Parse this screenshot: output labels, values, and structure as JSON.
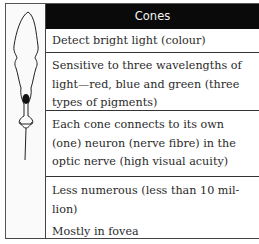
{
  "table": {
    "header": "Cones",
    "rows": [
      {
        "lines": [
          "Detect bright light (colour)"
        ]
      },
      {
        "lines": [
          "Sensitive to three wavelengths of",
          "light—red, blue and green (three",
          "types of pigments)"
        ]
      },
      {
        "lines": [
          "Each cone connects to its own",
          "(one) neuron (nerve fibre) in the",
          "optic nerve (high visual acuity)"
        ]
      },
      {
        "lines": [
          "Less numerous (less than 10 mil-",
          "lion)",
          "Mostly in fovea"
        ]
      }
    ]
  },
  "illustration": {
    "icon": "cone-cell-diagram-icon",
    "label": ""
  },
  "colors": {
    "header_bg": "#0a0a0a",
    "header_text": "#f2f2f2",
    "border": "#333333"
  }
}
